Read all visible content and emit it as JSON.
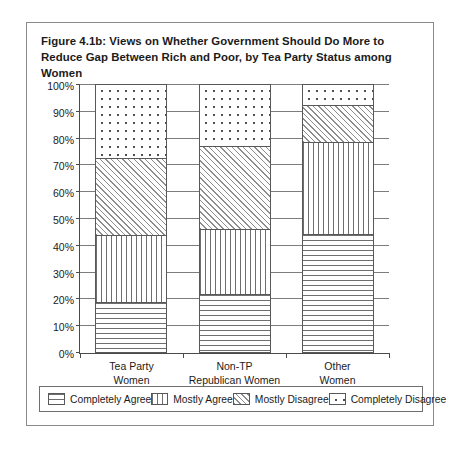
{
  "figure": {
    "title": "Figure 4.1b: Views on Whether Government Should Do More to Reduce Gap Between Rich and Poor, by Tea Party Status among Women"
  },
  "chart_data": {
    "type": "bar",
    "subtype": "stacked-percentage-column",
    "title": "Figure 4.1b: Views on Whether Government Should Do More to Reduce Gap Between Rich and Poor, by Tea Party Status among Women",
    "xlabel": "",
    "ylabel": "",
    "ylim": [
      0,
      100
    ],
    "grid": true,
    "legend_position": "bottom",
    "categories": [
      "Tea Party Women",
      "Non-TP Republican Women",
      "Other Women"
    ],
    "category_lines": [
      [
        "Tea Party",
        "Women"
      ],
      [
        "Non-TP",
        "Republican Women"
      ],
      [
        "Other",
        "Women"
      ]
    ],
    "ytick_labels": [
      "0%",
      "10%",
      "20%",
      "30%",
      "40%",
      "50%",
      "60%",
      "70%",
      "80%",
      "90%",
      "100%"
    ],
    "ytick_values": [
      0,
      10,
      20,
      30,
      40,
      50,
      60,
      70,
      80,
      90,
      100
    ],
    "series": [
      {
        "name": "Completely Agree",
        "pattern": "horizontal-lines",
        "values": [
          18.5,
          21.5,
          44
        ]
      },
      {
        "name": "Mostly Agree",
        "pattern": "vertical-lines",
        "values": [
          25,
          24.5,
          34.5
        ]
      },
      {
        "name": "Mostly Disagree",
        "pattern": "diagonal-hatch",
        "values": [
          29,
          31,
          13.5
        ]
      },
      {
        "name": "Completely Disagree",
        "pattern": "dots",
        "values": [
          27.5,
          23,
          8
        ]
      }
    ],
    "cumulative_tops": [
      [
        18.5,
        43.5,
        72.5,
        100
      ],
      [
        21.5,
        46,
        77,
        100
      ],
      [
        44,
        78.5,
        92,
        100
      ]
    ]
  },
  "legend": {
    "items": [
      {
        "label": "Completely Agree",
        "pattern": "horizontal-lines"
      },
      {
        "label": "Mostly Agree",
        "pattern": "vertical-lines"
      },
      {
        "label": "Mostly Disagree",
        "pattern": "diagonal-hatch"
      },
      {
        "label": "Completely Disagree",
        "pattern": "dots"
      }
    ]
  }
}
